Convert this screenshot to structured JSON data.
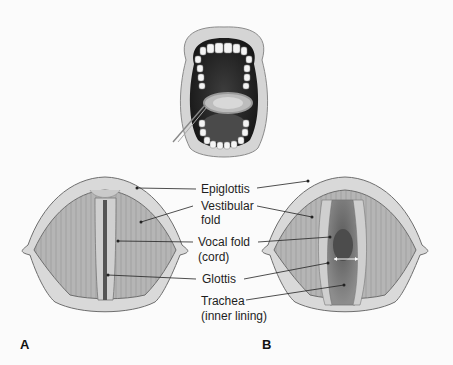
{
  "figure": {
    "top_illustration": "open-mouth-with-laryngeal-mirror",
    "panels": [
      {
        "id": "A",
        "label": "A",
        "state": "vocal folds closed"
      },
      {
        "id": "B",
        "label": "B",
        "state": "vocal folds open"
      }
    ],
    "labels": {
      "epiglottis": "Epiglottis",
      "vestibular_1": "Vestibular",
      "vestibular_2": "fold",
      "vocal_1": "Vocal fold",
      "vocal_2": "(cord)",
      "glottis": "Glottis",
      "trachea_1": "Trachea",
      "trachea_2": "(inner lining)"
    },
    "colors": {
      "tissue_fill": "#b9b9b9",
      "rim_fill": "#d7d7d7",
      "outline": "#6e6e6e",
      "dark_cavity": "#3a3a3a",
      "leader_line": "#222222"
    }
  }
}
